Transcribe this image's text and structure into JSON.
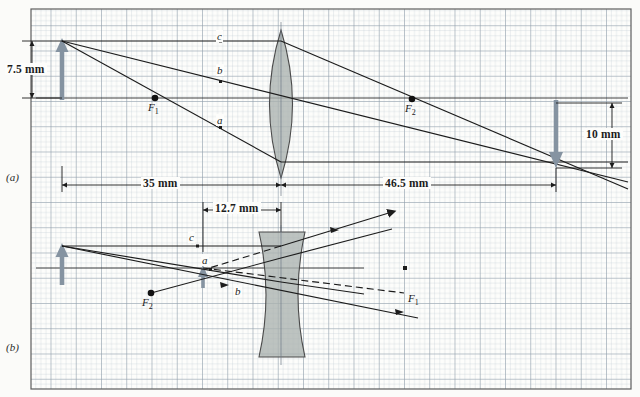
{
  "figure": {
    "background_color": "#fbfbf9",
    "grid_color": "#b9c4cf",
    "grid_major_color": "#8d9aa8",
    "ray_color": "#1c1c1c",
    "object_arrow_color": "#7e8f9e",
    "lens_fill": "#a8b0ae",
    "border_color": "#6e6e6e"
  },
  "panels": [
    {
      "id": "a",
      "label": "(a)",
      "lens_type": "converging",
      "object_height_label": "7.5 mm",
      "image_height_label": "10 mm",
      "object_distance_label": "35 mm",
      "image_distance_label": "46.5 mm",
      "focal_near_label": "F",
      "focal_near_sub": "1",
      "focal_far_label": "F",
      "focal_far_sub": "2",
      "rays": [
        {
          "name": "a",
          "label": "a"
        },
        {
          "name": "b",
          "label": "b"
        },
        {
          "name": "c",
          "label": "c"
        }
      ]
    },
    {
      "id": "b",
      "label": "(b)",
      "lens_type": "diverging",
      "image_distance_label": "12.7 mm",
      "focal_near_label": "F",
      "focal_near_sub": "2",
      "focal_far_label": "F",
      "focal_far_sub": "1",
      "rays": [
        {
          "name": "a",
          "label": "a"
        },
        {
          "name": "b",
          "label": "b"
        },
        {
          "name": "c",
          "label": "c"
        }
      ]
    }
  ],
  "labels": {
    "panel_a": "(a)",
    "panel_b": "(b)",
    "dim_75mm": "7.5 mm",
    "dim_35mm": "35 mm",
    "dim_465mm": "46.5 mm",
    "dim_10mm": "10 mm",
    "dim_127mm": "12.7 mm",
    "ray_a_top": "a",
    "ray_b_top": "b",
    "ray_c_top": "c",
    "ray_a_bot": "a",
    "ray_b_bot": "b",
    "ray_c_bot": "c",
    "f1_top": "F",
    "f1_top_sub": "1",
    "f2_top": "F",
    "f2_top_sub": "2",
    "f2_bot": "F",
    "f2_bot_sub": "2",
    "f1_bot": "F",
    "f1_bot_sub": "1"
  }
}
